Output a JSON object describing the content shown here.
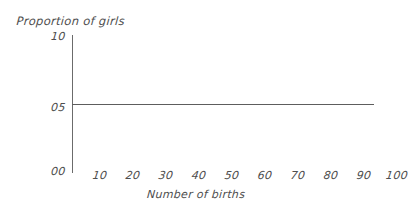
{
  "chart_data": {
    "type": "line",
    "title": "",
    "xlabel": "Number of births",
    "ylabel": "Proportion of girls",
    "xlim": [
      0,
      105
    ],
    "ylim": [
      0.0,
      1.0
    ],
    "grid": false,
    "legend": "none",
    "x_ticks": [
      {
        "value": 10,
        "label": "10"
      },
      {
        "value": 20,
        "label": "20"
      },
      {
        "value": 30,
        "label": "30"
      },
      {
        "value": 40,
        "label": "40"
      },
      {
        "value": 50,
        "label": "50"
      },
      {
        "value": 60,
        "label": "60"
      },
      {
        "value": 70,
        "label": "70"
      },
      {
        "value": 80,
        "label": "80"
      },
      {
        "value": 90,
        "label": "90"
      },
      {
        "value": 100,
        "label": "100"
      }
    ],
    "y_ticks": [
      {
        "value": 1.0,
        "label": "10"
      },
      {
        "value": 0.5,
        "label": "05"
      },
      {
        "value": 0.0,
        "label": "00"
      }
    ],
    "series": [
      {
        "name": "Proportion of girls",
        "color": "#5d5d5d",
        "x": [
          0,
          105
        ],
        "values": [
          0.5,
          0.5
        ]
      }
    ],
    "annotations": []
  },
  "axes": {
    "y_axis_line_color": "#6b6b6b",
    "x_axis_line_shown": false
  },
  "canvas": {
    "background": "#ffffff",
    "width": 392,
    "height": 210
  }
}
